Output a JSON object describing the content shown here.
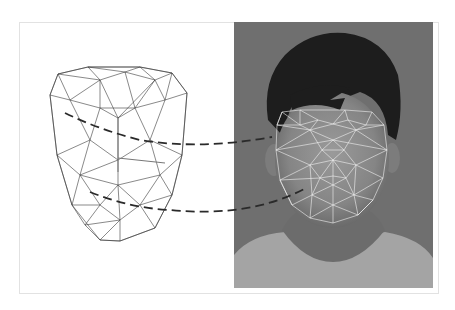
{
  "figure": {
    "frame": {
      "x": 19,
      "y": 22,
      "w": 420,
      "h": 272,
      "border": "#e2e2e2"
    },
    "colors": {
      "background": "#ffffff",
      "wireframe_stroke": "#3a3a3a",
      "photo_bg": "#6f6f6f",
      "hair": "#1c1c1c",
      "skin": "#8c8c8c",
      "shirt": "#a8a8a8",
      "landmark_mesh": "#f2f2f2",
      "dashed_connector": "#2a2a2a"
    },
    "photo": {
      "x": 234,
      "y": 22,
      "w": 199,
      "h": 266
    },
    "wireframe_model": {
      "outline": [
        [
          50,
          95
        ],
        [
          58,
          74
        ],
        [
          88,
          67
        ],
        [
          140,
          67
        ],
        [
          172,
          73
        ],
        [
          187,
          93
        ],
        [
          182,
          155
        ],
        [
          172,
          195
        ],
        [
          155,
          228
        ],
        [
          120,
          241
        ],
        [
          100,
          240
        ],
        [
          72,
          205
        ],
        [
          57,
          155
        ]
      ],
      "nodes": [
        [
          88,
          67
        ],
        [
          140,
          67
        ],
        [
          172,
          73
        ],
        [
          58,
          74
        ],
        [
          50,
          95
        ],
        [
          187,
          93
        ],
        [
          100,
          80
        ],
        [
          125,
          72
        ],
        [
          155,
          80
        ],
        [
          70,
          100
        ],
        [
          100,
          108
        ],
        [
          135,
          108
        ],
        [
          165,
          100
        ],
        [
          118,
          118
        ],
        [
          118,
          160
        ],
        [
          57,
          155
        ],
        [
          182,
          155
        ],
        [
          90,
          140
        ],
        [
          150,
          140
        ],
        [
          118,
          185
        ],
        [
          80,
          175
        ],
        [
          160,
          175
        ],
        [
          72,
          205
        ],
        [
          172,
          195
        ],
        [
          100,
          205
        ],
        [
          140,
          205
        ],
        [
          120,
          241
        ],
        [
          100,
          240
        ],
        [
          155,
          228
        ],
        [
          85,
          225
        ],
        [
          120,
          220
        ]
      ],
      "edges": [
        [
          0,
          1
        ],
        [
          1,
          2
        ],
        [
          0,
          3
        ],
        [
          3,
          4
        ],
        [
          2,
          5
        ],
        [
          3,
          6
        ],
        [
          0,
          6
        ],
        [
          6,
          7
        ],
        [
          0,
          7
        ],
        [
          7,
          1
        ],
        [
          1,
          8
        ],
        [
          7,
          8
        ],
        [
          8,
          2
        ],
        [
          2,
          12
        ],
        [
          8,
          12
        ],
        [
          5,
          12
        ],
        [
          4,
          9
        ],
        [
          3,
          9
        ],
        [
          6,
          9
        ],
        [
          9,
          10
        ],
        [
          6,
          10
        ],
        [
          10,
          11
        ],
        [
          7,
          11
        ],
        [
          11,
          8
        ],
        [
          11,
          12
        ],
        [
          10,
          13
        ],
        [
          11,
          13
        ],
        [
          9,
          17
        ],
        [
          4,
          15
        ],
        [
          15,
          17
        ],
        [
          10,
          17
        ],
        [
          13,
          14
        ],
        [
          17,
          14
        ],
        [
          11,
          18
        ],
        [
          12,
          18
        ],
        [
          5,
          16
        ],
        [
          16,
          18
        ],
        [
          18,
          14
        ],
        [
          15,
          20
        ],
        [
          17,
          20
        ],
        [
          20,
          14
        ],
        [
          14,
          19
        ],
        [
          18,
          21
        ],
        [
          16,
          21
        ],
        [
          21,
          19
        ],
        [
          20,
          19
        ],
        [
          15,
          22
        ],
        [
          20,
          22
        ],
        [
          22,
          24
        ],
        [
          20,
          24
        ],
        [
          24,
          19
        ],
        [
          19,
          25
        ],
        [
          21,
          25
        ],
        [
          25,
          23
        ],
        [
          21,
          23
        ],
        [
          16,
          23
        ],
        [
          22,
          29
        ],
        [
          24,
          29
        ],
        [
          29,
          27
        ],
        [
          24,
          30
        ],
        [
          30,
          25
        ],
        [
          25,
          28
        ],
        [
          23,
          28
        ],
        [
          28,
          26
        ],
        [
          30,
          26
        ],
        [
          30,
          27
        ],
        [
          27,
          26
        ],
        [
          29,
          30
        ],
        [
          19,
          30
        ],
        [
          6,
          13
        ],
        [
          8,
          13
        ]
      ],
      "axis_arrows": [
        [
          [
            118,
            172
          ],
          [
            118,
            118
          ]
        ],
        [
          [
            118,
            158
          ],
          [
            165,
            163
          ]
        ]
      ]
    },
    "landmark_mesh": {
      "outline": [
        [
          282,
          112
        ],
        [
          300,
          110
        ],
        [
          345,
          110
        ],
        [
          372,
          112
        ],
        [
          384,
          125
        ],
        [
          387,
          150
        ],
        [
          383,
          178
        ],
        [
          373,
          200
        ],
        [
          358,
          215
        ],
        [
          333,
          223
        ],
        [
          310,
          218
        ],
        [
          292,
          205
        ],
        [
          280,
          180
        ],
        [
          276,
          150
        ],
        [
          277,
          125
        ]
      ],
      "nodes": [
        [
          282,
          112
        ],
        [
          300,
          110
        ],
        [
          345,
          110
        ],
        [
          372,
          112
        ],
        [
          384,
          125
        ],
        [
          387,
          150
        ],
        [
          383,
          178
        ],
        [
          373,
          200
        ],
        [
          358,
          215
        ],
        [
          333,
          223
        ],
        [
          310,
          218
        ],
        [
          292,
          205
        ],
        [
          280,
          180
        ],
        [
          276,
          150
        ],
        [
          277,
          125
        ],
        [
          300,
          125
        ],
        [
          318,
          120
        ],
        [
          333,
          124
        ],
        [
          348,
          120
        ],
        [
          366,
          125
        ],
        [
          310,
          130
        ],
        [
          356,
          130
        ],
        [
          333,
          140
        ],
        [
          322,
          150
        ],
        [
          344,
          150
        ],
        [
          333,
          160
        ],
        [
          310,
          165
        ],
        [
          356,
          165
        ],
        [
          320,
          178
        ],
        [
          333,
          176
        ],
        [
          346,
          178
        ],
        [
          333,
          185
        ],
        [
          312,
          195
        ],
        [
          354,
          195
        ],
        [
          333,
          205
        ]
      ],
      "edges": [
        [
          0,
          15
        ],
        [
          1,
          15
        ],
        [
          1,
          16
        ],
        [
          15,
          16
        ],
        [
          16,
          17
        ],
        [
          2,
          17
        ],
        [
          2,
          18
        ],
        [
          17,
          18
        ],
        [
          18,
          19
        ],
        [
          3,
          19
        ],
        [
          4,
          19
        ],
        [
          0,
          14
        ],
        [
          14,
          15
        ],
        [
          15,
          20
        ],
        [
          16,
          20
        ],
        [
          17,
          20
        ],
        [
          17,
          21
        ],
        [
          18,
          21
        ],
        [
          19,
          21
        ],
        [
          4,
          21
        ],
        [
          5,
          21
        ],
        [
          14,
          20
        ],
        [
          13,
          20
        ],
        [
          13,
          22
        ],
        [
          20,
          22
        ],
        [
          21,
          22
        ],
        [
          5,
          22
        ],
        [
          20,
          23
        ],
        [
          22,
          23
        ],
        [
          21,
          24
        ],
        [
          22,
          24
        ],
        [
          23,
          24
        ],
        [
          23,
          25
        ],
        [
          24,
          25
        ],
        [
          13,
          26
        ],
        [
          23,
          26
        ],
        [
          12,
          26
        ],
        [
          5,
          27
        ],
        [
          24,
          27
        ],
        [
          6,
          27
        ],
        [
          25,
          26
        ],
        [
          25,
          27
        ],
        [
          26,
          28
        ],
        [
          25,
          28
        ],
        [
          25,
          29
        ],
        [
          28,
          29
        ],
        [
          29,
          30
        ],
        [
          25,
          30
        ],
        [
          27,
          30
        ],
        [
          28,
          31
        ],
        [
          29,
          31
        ],
        [
          30,
          31
        ],
        [
          12,
          28
        ],
        [
          11,
          32
        ],
        [
          26,
          32
        ],
        [
          28,
          32
        ],
        [
          31,
          32
        ],
        [
          6,
          33
        ],
        [
          7,
          33
        ],
        [
          27,
          33
        ],
        [
          30,
          33
        ],
        [
          31,
          33
        ],
        [
          32,
          34
        ],
        [
          31,
          34
        ],
        [
          33,
          34
        ],
        [
          10,
          32
        ],
        [
          10,
          34
        ],
        [
          9,
          34
        ],
        [
          8,
          34
        ],
        [
          8,
          33
        ],
        [
          11,
          12
        ],
        [
          7,
          8
        ]
      ]
    },
    "connectors": [
      {
        "from": "wireframe-eye-region",
        "to": "photo-eye-region",
        "path": "M65,113 Q100,130 140,140 Q200,150 272,137"
      },
      {
        "from": "wireframe-mouth-region",
        "to": "photo-mouth-region",
        "path": "M90,192 Q130,208 170,210 Q250,218 306,188"
      }
    ]
  }
}
